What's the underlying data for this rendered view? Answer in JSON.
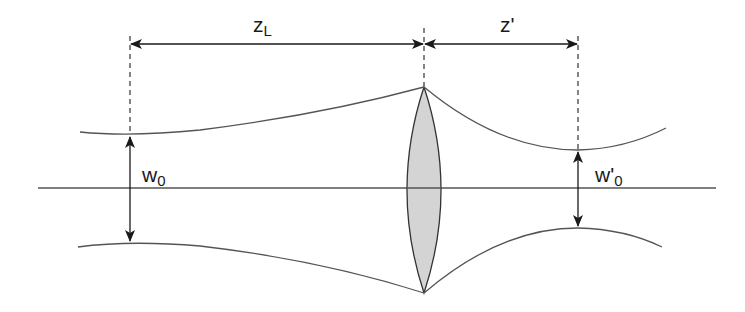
{
  "diagram": {
    "labels": {
      "z_L": {
        "main": "z",
        "sub": "L"
      },
      "z_prime": {
        "main": "z'"
      },
      "w_0": {
        "main": "w",
        "sub": "0"
      },
      "w_prime_0": {
        "main": "w'",
        "sub": "0"
      }
    },
    "colors": {
      "line": "#555555",
      "arrow": "#1a1a1a",
      "lens_fill": "#d4d4d4",
      "lens_stroke": "#333333",
      "background": "#ffffff"
    },
    "elements": [
      "optical-axis",
      "input-beam",
      "lens",
      "output-beam",
      "waist-w0",
      "waist-w0-prime",
      "distance-zL",
      "distance-z-prime"
    ]
  }
}
